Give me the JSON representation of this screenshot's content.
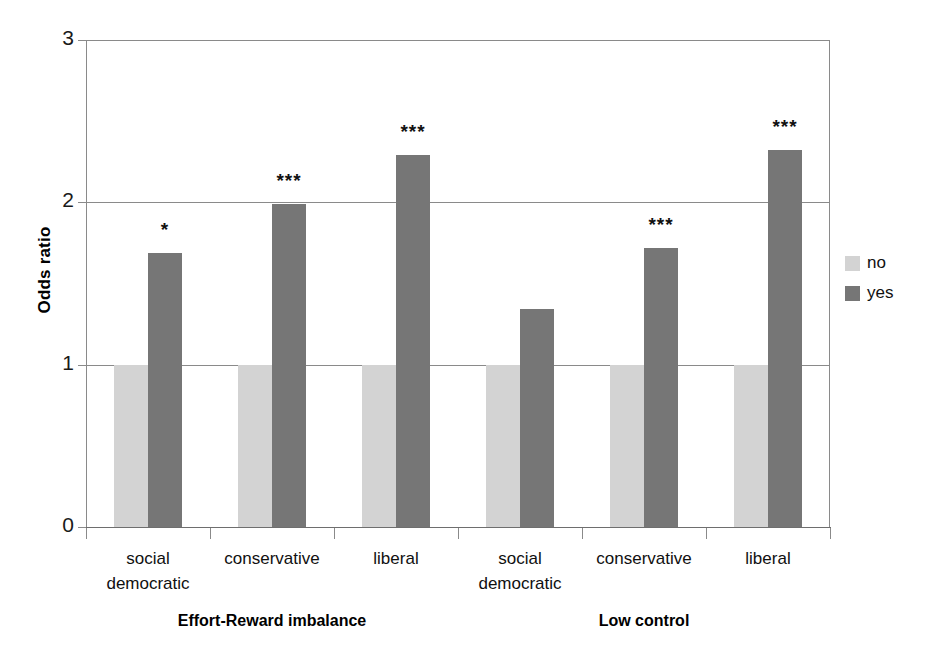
{
  "figure": {
    "title_remnant": "............................",
    "ylabel": "Odds ratio",
    "ytick_labels": [
      "0",
      "1",
      "2",
      "3"
    ],
    "group_labels": [
      "Effort-Reward imbalance",
      "Low control"
    ],
    "legend": [
      {
        "label": "no",
        "color": "#d3d3d3"
      },
      {
        "label": "yes",
        "color": "#767676"
      }
    ]
  },
  "chart_data": {
    "type": "bar",
    "title": "",
    "xlabel": "",
    "ylabel": "Odds ratio",
    "ylim": [
      0,
      3
    ],
    "yticks": [
      0,
      1,
      2,
      3
    ],
    "grid": true,
    "legend_position": "right",
    "group_labels": [
      "Effort-Reward imbalance",
      "Low control"
    ],
    "categories": [
      "social democratic",
      "conservative",
      "liberal",
      "social democratic",
      "conservative",
      "liberal"
    ],
    "category_lines": [
      [
        "social",
        "democratic"
      ],
      [
        "conservative",
        ""
      ],
      [
        "liberal",
        ""
      ],
      [
        "social",
        "democratic"
      ],
      [
        "conservative",
        ""
      ],
      [
        "liberal",
        ""
      ]
    ],
    "series": [
      {
        "name": "no",
        "color": "#d3d3d3",
        "values": [
          1.0,
          1.0,
          1.0,
          1.0,
          1.0,
          1.0
        ]
      },
      {
        "name": "yes",
        "color": "#767676",
        "values": [
          1.69,
          1.99,
          2.29,
          1.34,
          1.72,
          2.32
        ]
      }
    ],
    "annotations": [
      "*",
      "***",
      "***",
      "",
      "***",
      "***"
    ],
    "annotation_note": "* p<0.05, *** p<0.001 significance markers above the 'yes' bars"
  }
}
